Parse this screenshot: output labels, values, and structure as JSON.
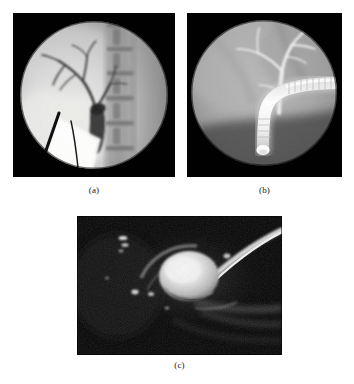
{
  "figure": {
    "background_color": "#ffffff",
    "panel_background_color": "#000000",
    "caption_color": "#1a1a1a",
    "panels": [
      {
        "id": "a",
        "caption": "(a)",
        "modality": "fluoroscopic percutaneous transhepatic cholangiogram",
        "field_shape": "circular",
        "description": "Circular fluoroscopic field showing a branching intrahepatic biliary tree filled with contrast, a dilated common bile duct descending toward the porta hepatis, two linear radiopaque instruments (needle and guidewire) entering from the lower left, a bright collimated wedge of overexposure at lower left, and the lumbar vertebral column with disc spaces along the right side of the field.",
        "features": [
          "circular collimated field of view",
          "branching intrahepatic bile ducts",
          "common bile duct",
          "percutaneous needle",
          "guidewire",
          "lumbar vertebral bodies",
          "bright collimation wedge"
        ]
      },
      {
        "id": "b",
        "caption": "(b)",
        "modality": "endoscopic retrograde cholangiopancreatography (ERCP)",
        "field_shape": "circular",
        "description": "Circular fluoroscopic field showing a bright banded duodenoscope entering from the right, running horizontally and bending sharply downward to a rounded distal tip, with a contrast-opacified common hepatic duct and bifurcating intrahepatic ducts extending upward from the scope tip region.",
        "features": [
          "circular collimated field of view",
          "duodenoscope shaft with segmented bands",
          "scope bending section",
          "rounded scope tip",
          "common hepatic duct",
          "bifurcating intrahepatic bile ducts"
        ]
      },
      {
        "id": "c",
        "caption": "(c)",
        "modality": "dark-field radiographic / endoscopic image",
        "field_shape": "rectangular",
        "description": "Dark rectangular image with a bright rounded calculus near the centre casting a dark crescent shadow, a curved bright instrument band sweeping from the upper right across to the centre, several small bright calcific specks in the left half, and faint bright soft-tissue bands along the lower right.",
        "features": [
          "bright rounded calculus",
          "crescent acoustic shadow",
          "curved instrument band",
          "scattered bright calcifications",
          "faint soft-tissue bands"
        ]
      }
    ]
  }
}
